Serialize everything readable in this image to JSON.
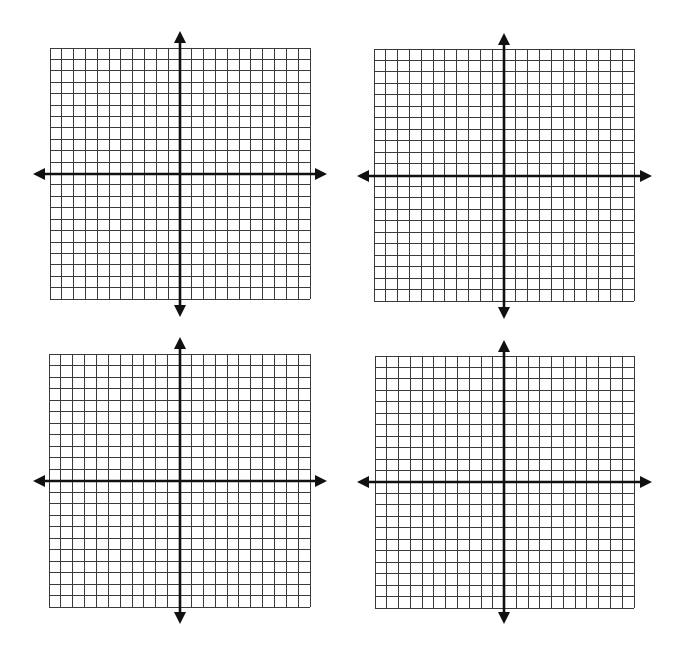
{
  "page": {
    "background": "#ffffff"
  },
  "style": {
    "grid_color": "#3a3a3a",
    "axis_color": "#111111",
    "grid_stroke": 1,
    "axis_stroke": 2.6
  },
  "planes": [
    {
      "id": "top-left",
      "grid": {
        "x": 50,
        "y": 48,
        "width": 260,
        "height": 251,
        "cols": 22,
        "rows": 22
      },
      "y_axis_x": 180,
      "x_axis_y": 174,
      "x_arrow": {
        "left": 33,
        "right": 327
      },
      "y_arrow": {
        "top": 31,
        "bottom": 317
      }
    },
    {
      "id": "top-right",
      "grid": {
        "x": 374,
        "y": 49,
        "width": 260,
        "height": 252,
        "cols": 22,
        "rows": 22
      },
      "y_axis_x": 504,
      "x_axis_y": 176,
      "x_arrow": {
        "left": 357,
        "right": 652
      },
      "y_arrow": {
        "top": 33,
        "bottom": 319
      }
    },
    {
      "id": "bottom-left",
      "grid": {
        "x": 49,
        "y": 354,
        "width": 261,
        "height": 253,
        "cols": 22,
        "rows": 22
      },
      "y_axis_x": 180,
      "x_axis_y": 481,
      "x_arrow": {
        "left": 33,
        "right": 327
      },
      "y_arrow": {
        "top": 337,
        "bottom": 624
      }
    },
    {
      "id": "bottom-right",
      "grid": {
        "x": 375,
        "y": 356,
        "width": 259,
        "height": 252,
        "cols": 22,
        "rows": 22
      },
      "y_axis_x": 504,
      "x_axis_y": 482,
      "x_arrow": {
        "left": 357,
        "right": 652
      },
      "y_arrow": {
        "top": 340,
        "bottom": 624
      }
    }
  ]
}
